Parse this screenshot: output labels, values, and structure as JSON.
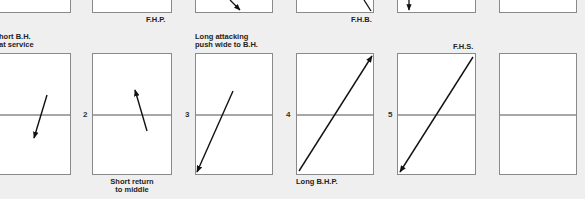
{
  "top_row": {
    "labels": [
      {
        "id": "fhp",
        "text": "F.H.P."
      },
      {
        "id": "fhb",
        "text": "F.H.B."
      }
    ]
  },
  "bottom_row": {
    "panels": [
      {
        "number": "",
        "caption_top": [
          "Short B.H.",
          "float service"
        ],
        "caption_top_visible": [
          "hort B.H.",
          "at service"
        ],
        "caption_bottom": [],
        "arrow": "down-left short"
      },
      {
        "number": "2",
        "caption_top": [],
        "caption_bottom": [
          "Short return",
          "to middle"
        ],
        "arrow": "up-left short"
      },
      {
        "number": "3",
        "caption_top": [
          "Long attacking",
          "push wide to B.H."
        ],
        "caption_bottom": [],
        "arrow": "down-left long"
      },
      {
        "number": "4",
        "caption_top": [],
        "caption_bottom": [
          "Long B.H.P."
        ],
        "arrow": "up-right long"
      },
      {
        "number": "5",
        "caption_top": [
          "F.H.S."
        ],
        "caption_bottom": [],
        "arrow": "down-left long"
      },
      {
        "number": "",
        "caption_top": [],
        "caption_bottom": [],
        "arrow": "none"
      }
    ]
  },
  "colors": {
    "background": "#efefef",
    "court": "#ffffff",
    "border": "#8a8a8a",
    "arrow": "#111111"
  }
}
